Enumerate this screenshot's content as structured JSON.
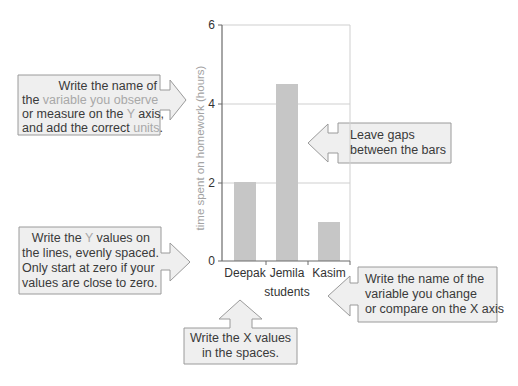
{
  "chart_data": {
    "type": "bar",
    "title": "",
    "categories": [
      "Deepak",
      "Jemila",
      "Kasim"
    ],
    "values": [
      2,
      4.5,
      1
    ],
    "xlabel": "students",
    "ylabel": "time spent on homework (hours)",
    "ylim": [
      0,
      6
    ],
    "yticks": [
      0,
      2,
      4,
      6
    ],
    "grid": true,
    "legend": null
  },
  "chart": {
    "y_ticks": [
      "6",
      "4",
      "2",
      "0"
    ],
    "x_ticks": [
      "Deepak",
      "Jemila",
      "Kasim"
    ],
    "x_title": "students",
    "y_title": "time spent on homework (hours)",
    "colors": {
      "bar": "#c6c6c6",
      "axis": "#6b6b6b",
      "grid": "#cfcfcf"
    }
  },
  "callouts": {
    "y_axis_name": {
      "arrow": "right-arrow",
      "lines": [
        [
          {
            "t": "Write the name of"
          }
        ],
        [
          {
            "t": "the "
          },
          {
            "t": "variable you observe",
            "hl": true
          }
        ],
        [
          {
            "t": "or measure on the "
          },
          {
            "t": "Y",
            "hl": true
          },
          {
            "t": " axis,"
          }
        ],
        [
          {
            "t": "and add the correct "
          },
          {
            "t": "units",
            "hl": true
          },
          {
            "t": "."
          }
        ]
      ]
    },
    "gaps": {
      "arrow": "left-arrow",
      "lines": [
        [
          {
            "t": "Leave gaps"
          }
        ],
        [
          {
            "t": "between the bars"
          }
        ]
      ]
    },
    "y_values": {
      "arrow": "right-arrow",
      "lines": [
        [
          {
            "t": "Write the "
          },
          {
            "t": "Y",
            "hl": true
          },
          {
            "t": " values on"
          }
        ],
        [
          {
            "t": "the lines, evenly spaced."
          }
        ],
        [
          {
            "t": "Only start at zero if your"
          }
        ],
        [
          {
            "t": "values are close to zero."
          }
        ]
      ]
    },
    "x_axis_name": {
      "arrow": "left-arrow",
      "lines": [
        [
          {
            "t": "Write the name of the"
          }
        ],
        [
          {
            "t": "variable you change"
          }
        ],
        [
          {
            "t": "or compare on the X axis"
          }
        ]
      ]
    },
    "x_values": {
      "arrow": "up-arrow",
      "lines": [
        [
          {
            "t": "Write the X values"
          }
        ],
        [
          {
            "t": "in the spaces."
          }
        ]
      ]
    }
  },
  "colors": {
    "callout_fill": "#efefef",
    "callout_border": "#9a9a9a",
    "text": "#3a3a3a",
    "highlight_text": "#a8a8a8"
  }
}
